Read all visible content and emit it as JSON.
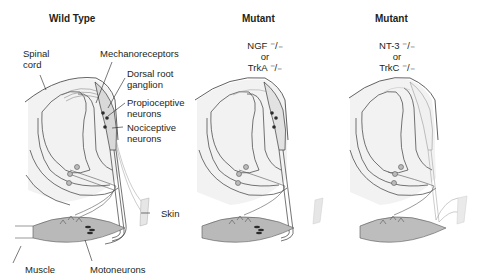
{
  "panels": [
    {
      "id": "wild-type",
      "title": "Wild Type",
      "genotype": null,
      "labels": {
        "spinal_cord": [
          "Spinal",
          "cord"
        ],
        "mechanoreceptors": "Mechanoreceptors",
        "drg": [
          "Dorsal root",
          "ganglion"
        ],
        "proprioceptive": [
          "Propioceptive",
          "neurons"
        ],
        "nociceptive": [
          "Nociceptive",
          "neurons"
        ],
        "skin": "Skin",
        "muscle": "Muscle",
        "motoneurons": "Motoneurons"
      }
    },
    {
      "id": "mutant-ngf-trka",
      "title": "Mutant",
      "genotype": [
        "NGF ⁻/₋",
        "or",
        "TrkA ⁻/₋"
      ]
    },
    {
      "id": "mutant-nt3-trkc",
      "title": "Mutant",
      "genotype": [
        "NT-3 ⁻/₋",
        "or",
        "TrkC ⁻/₋"
      ]
    }
  ],
  "colors": {
    "line": "#3a3a3a",
    "cord_fill": "#f2f2f2",
    "muscle_fill": "#b9b9b9",
    "neuron_dot": "#2b2b2b",
    "skin_fill": "#e6e6e6"
  }
}
